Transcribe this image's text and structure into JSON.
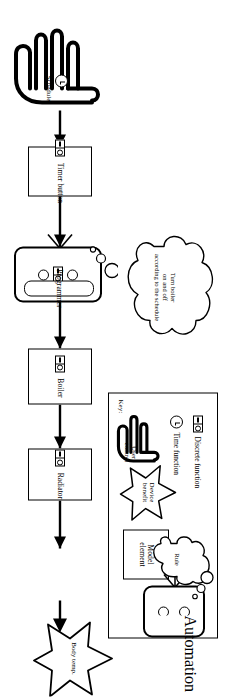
{
  "diagram": {
    "orientation": "rotated-90",
    "flow": {
      "start_label": "Schedule",
      "end_label": "Body temp.",
      "nodes": [
        {
          "id": "schedule",
          "label": "Schedule",
          "shape": "hand",
          "icon": "time-function-icon"
        },
        {
          "id": "timer-button",
          "label": "Timer button",
          "shape": "rectangle",
          "icon": "discrete-function-icon"
        },
        {
          "id": "programmer",
          "label": "Programmer",
          "shape": "automation",
          "icon": "discrete-function-icon"
        },
        {
          "id": "boiler",
          "label": "Boiler",
          "shape": "rectangle",
          "icon": "discrete-function-icon"
        },
        {
          "id": "radiator",
          "label": "Radiator",
          "shape": "rectangle",
          "icon": "discrete-function-icon"
        },
        {
          "id": "body-temp",
          "label": "Body temp.",
          "shape": "star",
          "icon": "none"
        }
      ]
    },
    "rule_cloud": {
      "line1": "Turn boiler",
      "line2": "on and off",
      "line3": "according to the schedule",
      "full_text": "Turn boiler on and off according to the schedule"
    },
    "key": {
      "title": "Key:",
      "icon_entries": [
        {
          "icon": "discrete-function-icon",
          "label": "Discrete function"
        },
        {
          "icon": "time-function-icon",
          "label": "Time function"
        }
      ],
      "shape_entries": [
        {
          "shape": "hand",
          "line1": "User",
          "line2": "control",
          "label": "User control"
        },
        {
          "shape": "star",
          "line1": "Device",
          "line2": "benefit",
          "label": "Device benefit"
        },
        {
          "shape": "rectangle",
          "line1": "Model",
          "line2": "element",
          "label": "Model element"
        },
        {
          "shape": "automation",
          "line1": "Automation",
          "line2": "",
          "label": "Automation"
        },
        {
          "shape": "cloud",
          "line1": "Rule",
          "line2": "",
          "label": "Rule"
        }
      ]
    },
    "colors": {
      "stroke": "#000000",
      "background": "#ffffff"
    }
  }
}
